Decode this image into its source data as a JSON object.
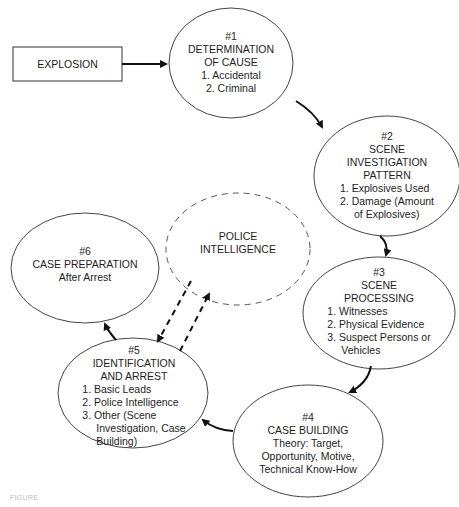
{
  "diagram": {
    "start_box": {
      "label": "EXPLOSION"
    },
    "nodes": [
      {
        "id": "1",
        "number": "#1",
        "title_lines": [
          "DETERMINATION",
          "OF CAUSE"
        ],
        "items": [
          "1. Accidental",
          "2. Criminal"
        ]
      },
      {
        "id": "2",
        "number": "#2",
        "title_lines": [
          "SCENE",
          "INVESTIGATION",
          "PATTERN"
        ],
        "items": [
          "1. Explosives Used",
          "2. Damage (Amount",
          "of Explosives)"
        ]
      },
      {
        "id": "3",
        "number": "#3",
        "title_lines": [
          "SCENE",
          "PROCESSING"
        ],
        "items": [
          "1. Witnesses",
          "2. Physical Evidence",
          "3. Suspect Persons or",
          "Vehicles"
        ]
      },
      {
        "id": "4",
        "number": "#4",
        "title_lines": [
          "CASE BUILDING"
        ],
        "items": [
          "Theory: Target,",
          "Opportunity, Motive,",
          "Technical Know-How"
        ]
      },
      {
        "id": "5",
        "number": "#5",
        "title_lines": [
          "IDENTIFICATION",
          "AND ARREST"
        ],
        "items": [
          "1. Basic Leads",
          "2. Police Intelligence",
          "3. Other (Scene",
          "Investigation, Case",
          "Building)"
        ]
      },
      {
        "id": "6",
        "number": "#6",
        "title_lines": [
          "CASE PREPARATION"
        ],
        "items": [
          "After Arrest"
        ]
      }
    ],
    "external_node": {
      "title_lines": [
        "POLICE",
        "INTELLIGENCE"
      ],
      "style": "dashed"
    },
    "edges": [
      {
        "from": "EXPLOSION",
        "to": "1",
        "style": "solid"
      },
      {
        "from": "1",
        "to": "2",
        "style": "solid"
      },
      {
        "from": "2",
        "to": "3",
        "style": "solid"
      },
      {
        "from": "3",
        "to": "4",
        "style": "solid"
      },
      {
        "from": "4",
        "to": "5",
        "style": "solid"
      },
      {
        "from": "5",
        "to": "6",
        "style": "solid"
      },
      {
        "from": "POLICE INTELLIGENCE",
        "to": "5",
        "style": "dashed"
      },
      {
        "from": "5",
        "to": "POLICE INTELLIGENCE",
        "style": "dashed"
      }
    ]
  },
  "caption": {
    "text": "FIGURE"
  },
  "colors": {
    "stroke": "#2a2a2a",
    "text": "#1e1e1e",
    "background": "#ffffff",
    "caption": "#bdbdbd"
  }
}
